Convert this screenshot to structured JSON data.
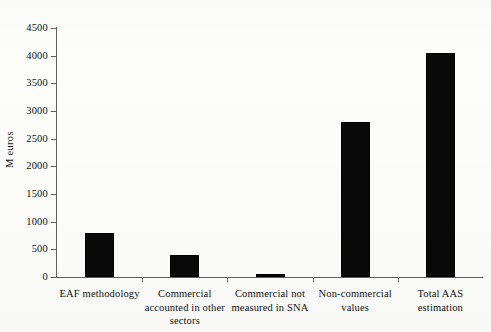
{
  "chart_data": {
    "type": "bar",
    "title": "",
    "xlabel": "",
    "ylabel": "M euros",
    "categories": [
      "EAF methodology",
      "Commercial accounted in other sectors",
      "Commercial not measured in SNA",
      "Non-commercial values",
      "Total AAS estimation"
    ],
    "category_lines": [
      [
        "EAF methodology"
      ],
      [
        "Commercial",
        "accounted in other",
        "sectors"
      ],
      [
        "Commercial not",
        "measured in SNA"
      ],
      [
        "Non-commercial",
        "values"
      ],
      [
        "Total AAS",
        "estimation"
      ]
    ],
    "values": [
      800,
      390,
      50,
      2800,
      4050
    ],
    "ylim": [
      0,
      4500
    ],
    "yticks": [
      0,
      500,
      1000,
      1500,
      2000,
      2500,
      3000,
      3500,
      4000,
      4500
    ],
    "ytick_labels": [
      "0",
      "500",
      "1000",
      "1500",
      "2000",
      "2500",
      "3000",
      "3500",
      "4000",
      "4500"
    ],
    "grid": false,
    "legend": false,
    "bar_color": "#090909",
    "axis_color": "#5f5f5f",
    "background": "#fdfdfc"
  }
}
